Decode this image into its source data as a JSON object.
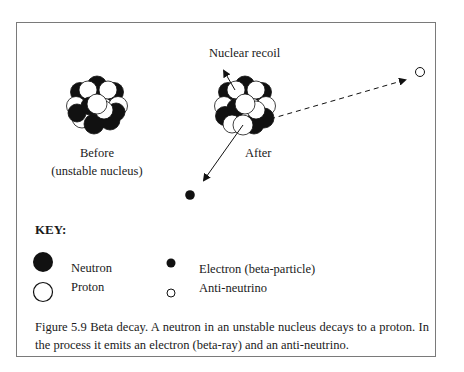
{
  "figure": {
    "labels": {
      "nuclear_recoil": "Nuclear recoil",
      "before_line1": "Before",
      "before_line2": "(unstable nucleus)",
      "after": "After"
    },
    "key": {
      "title": "KEY:",
      "items": [
        {
          "icon": "neutron-large-filled-circle",
          "label": "Neutron"
        },
        {
          "icon": "proton-large-hollow-circle",
          "label": "Proton"
        },
        {
          "icon": "electron-small-filled-circle",
          "label": "Electron (beta-particle)"
        },
        {
          "icon": "antineutrino-small-hollow-circle",
          "label": "Anti-neutrino"
        }
      ]
    },
    "caption": "Figure 5.9 Beta decay. A neutron in an unstable nucleus decays to a proton. In the process it emits an electron (beta-ray) and an anti-neutrino.",
    "colors": {
      "border": "#7a7a7a",
      "ink": "#111111",
      "paper": "#ffffff"
    }
  }
}
